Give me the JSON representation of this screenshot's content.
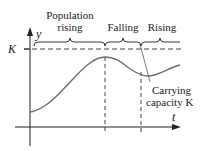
{
  "diagram": {
    "type": "logistic-growth-oscillation",
    "axes": {
      "y_label": "y",
      "x_label": "t",
      "k_label": "K"
    },
    "phases": [
      {
        "label_line1": "Population",
        "label_line2": "rising"
      },
      {
        "label_line1": "Falling",
        "label_line2": ""
      },
      {
        "label_line1": "Rising",
        "label_line2": ""
      }
    ],
    "annotation": {
      "line1": "Carrying",
      "line2": "capacity K"
    },
    "colors": {
      "axis": "#222222",
      "curve": "#6e6e6e",
      "dashed": "#444444",
      "text": "#222222"
    }
  }
}
